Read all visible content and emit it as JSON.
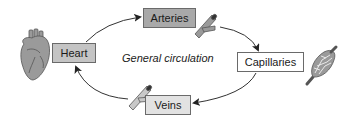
{
  "diagram": {
    "title": "General circulation",
    "nodes": [
      {
        "id": "heart",
        "label": "Heart",
        "fill": "#c4c4c4",
        "icon": "heart-organ-icon"
      },
      {
        "id": "arteries",
        "label": "Arteries",
        "fill": "#a9a9a9",
        "icon": "artery-vessel-icon"
      },
      {
        "id": "capillaries",
        "label": "Capillaries",
        "fill": "#ffffff",
        "icon": "capillary-network-icon"
      },
      {
        "id": "veins",
        "label": "Veins",
        "fill": "#e2e2e2",
        "icon": "vein-vessel-icon"
      }
    ],
    "edges": [
      {
        "from": "heart",
        "to": "arteries"
      },
      {
        "from": "arteries",
        "to": "capillaries"
      },
      {
        "from": "capillaries",
        "to": "veins"
      },
      {
        "from": "veins",
        "to": "heart"
      }
    ],
    "colors": {
      "line": "#333333",
      "box_border": "#6a6a6a",
      "illustration_fill": "#9a9a9a",
      "illustration_stroke": "#555555"
    }
  }
}
